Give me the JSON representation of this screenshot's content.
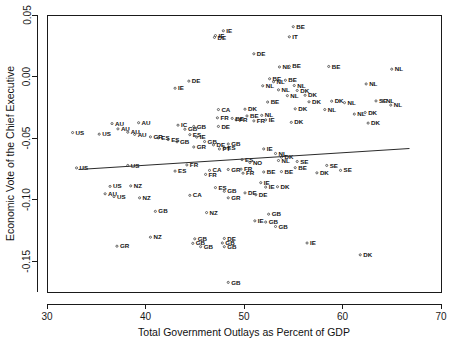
{
  "chart_data": {
    "type": "scatter",
    "title": "",
    "xlabel": "Total Government Outlays as Percent of GDP",
    "ylabel": "Economic Vote of the Chief Executive",
    "xlim": [
      30,
      70
    ],
    "ylim": [
      -0.175,
      0.05
    ],
    "xticks": [
      30,
      40,
      50,
      60,
      70
    ],
    "xtick_labels": [
      "30",
      "40",
      "50",
      "60",
      "70"
    ],
    "yticks": [
      0.05,
      0.0,
      -0.05,
      -0.1,
      -0.15
    ],
    "ytick_labels": [
      "0.05",
      "0.00",
      "-0.05",
      "-0.10",
      "-0.15"
    ],
    "grid": false,
    "legend": "none",
    "marker": "point-with-country-code-label",
    "fit_line": {
      "type": "linear-regression",
      "x_start": 33.2,
      "y_start": -0.0755,
      "x_end": 66.8,
      "y_end": -0.0585
    },
    "points": [
      {
        "label": "IE",
        "x": 47.9,
        "y": 0.0372
      },
      {
        "label": "IE",
        "x": 47.1,
        "y": 0.0333
      },
      {
        "label": "DE",
        "x": 47.0,
        "y": 0.0318
      },
      {
        "label": "BE",
        "x": 55.0,
        "y": 0.0405
      },
      {
        "label": "IT",
        "x": 54.6,
        "y": 0.0323
      },
      {
        "label": "DE",
        "x": 51.0,
        "y": 0.0185
      },
      {
        "label": "NL",
        "x": 53.6,
        "y": 0.0078
      },
      {
        "label": "BE",
        "x": 54.6,
        "y": 0.0083
      },
      {
        "label": "BE",
        "x": 58.6,
        "y": 0.0082
      },
      {
        "label": "DE",
        "x": 44.4,
        "y": -0.0037
      },
      {
        "label": "BE",
        "x": 52.6,
        "y": -0.0018
      },
      {
        "label": "NL",
        "x": 53.0,
        "y": -0.0042
      },
      {
        "label": "BE",
        "x": 54.2,
        "y": -0.003
      },
      {
        "label": "NL",
        "x": 51.9,
        "y": -0.0075
      },
      {
        "label": "NL",
        "x": 55.1,
        "y": -0.0073
      },
      {
        "label": "NL",
        "x": 62.4,
        "y": -0.006
      },
      {
        "label": "NL",
        "x": 65.0,
        "y": 0.006
      },
      {
        "label": "NL",
        "x": 53.5,
        "y": -0.0108
      },
      {
        "label": "DK",
        "x": 55.4,
        "y": -0.0113
      },
      {
        "label": "IE",
        "x": 43.0,
        "y": -0.0095
      },
      {
        "label": "NL",
        "x": 54.4,
        "y": -0.0155
      },
      {
        "label": "DK",
        "x": 56.2,
        "y": -0.0152
      },
      {
        "label": "AU",
        "x": 36.6,
        "y": -0.0382
      },
      {
        "label": "AU",
        "x": 39.3,
        "y": -0.0375
      },
      {
        "label": "AU",
        "x": 37.2,
        "y": -0.0425
      },
      {
        "label": "AU",
        "x": 38.9,
        "y": -0.047
      },
      {
        "label": "AU",
        "x": 38.2,
        "y": -0.0452
      },
      {
        "label": "US",
        "x": 32.6,
        "y": -0.0455
      },
      {
        "label": "US",
        "x": 35.3,
        "y": -0.0468
      },
      {
        "label": "IC",
        "x": 43.3,
        "y": -0.0395
      },
      {
        "label": "BE",
        "x": 52.4,
        "y": -0.0207
      },
      {
        "label": "DK",
        "x": 56.6,
        "y": -0.0205
      },
      {
        "label": "DK",
        "x": 58.9,
        "y": -0.02
      },
      {
        "label": "NL",
        "x": 60.2,
        "y": -0.0212
      },
      {
        "label": "SE",
        "x": 63.4,
        "y": -0.0198
      },
      {
        "label": "NL",
        "x": 64.1,
        "y": -0.02
      },
      {
        "label": "NL",
        "x": 64.9,
        "y": -0.0232
      },
      {
        "label": "CA",
        "x": 47.4,
        "y": -0.0268
      },
      {
        "label": "DK",
        "x": 50.1,
        "y": -0.0265
      },
      {
        "label": "DK",
        "x": 55.2,
        "y": -0.0262
      },
      {
        "label": "NL",
        "x": 58.2,
        "y": -0.0268
      },
      {
        "label": "GB",
        "x": 44.0,
        "y": -0.0428
      },
      {
        "label": "ES",
        "x": 44.5,
        "y": -0.0472
      },
      {
        "label": "IE",
        "x": 45.2,
        "y": -0.0492
      },
      {
        "label": "DE",
        "x": 47.4,
        "y": -0.0405
      },
      {
        "label": "GB",
        "x": 44.9,
        "y": -0.0405
      },
      {
        "label": "DK",
        "x": 62.3,
        "y": -0.0292
      },
      {
        "label": "NL",
        "x": 61.2,
        "y": -0.0305
      },
      {
        "label": "FR",
        "x": 49.2,
        "y": -0.0352
      },
      {
        "label": "BE",
        "x": 48.8,
        "y": -0.034
      },
      {
        "label": "FR",
        "x": 47.3,
        "y": -0.0335
      },
      {
        "label": "BE",
        "x": 50.3,
        "y": -0.032
      },
      {
        "label": "NL",
        "x": 51.8,
        "y": -0.0315
      },
      {
        "label": "IE",
        "x": 52.2,
        "y": -0.0352
      },
      {
        "label": "FR",
        "x": 51.0,
        "y": -0.036
      },
      {
        "label": "DK",
        "x": 54.8,
        "y": -0.0372
      },
      {
        "label": "DK",
        "x": 62.6,
        "y": -0.0378
      },
      {
        "label": "GB",
        "x": 43.2,
        "y": -0.053
      },
      {
        "label": "ES",
        "x": 42.3,
        "y": -0.0512
      },
      {
        "label": "ES",
        "x": 41.3,
        "y": -0.0498
      },
      {
        "label": "GR",
        "x": 40.5,
        "y": -0.049
      },
      {
        "label": "GB",
        "x": 46.0,
        "y": -0.0528
      },
      {
        "label": "DE",
        "x": 46.9,
        "y": -0.0555
      },
      {
        "label": "GB",
        "x": 48.4,
        "y": -0.0548
      },
      {
        "label": "ES",
        "x": 48.0,
        "y": -0.0582
      },
      {
        "label": "PT",
        "x": 47.5,
        "y": -0.0588
      },
      {
        "label": "GR",
        "x": 44.9,
        "y": -0.0572
      },
      {
        "label": "IE",
        "x": 52.0,
        "y": -0.0588
      },
      {
        "label": "NL",
        "x": 53.2,
        "y": -0.0625
      },
      {
        "label": "DK",
        "x": 53.8,
        "y": -0.0655
      },
      {
        "label": "NL",
        "x": 53.5,
        "y": -0.0682
      },
      {
        "label": "US",
        "x": 33.0,
        "y": -0.0742
      },
      {
        "label": "US",
        "x": 38.2,
        "y": -0.0722
      },
      {
        "label": "ES",
        "x": 43.0,
        "y": -0.0768
      },
      {
        "label": "CA",
        "x": 46.5,
        "y": -0.0762
      },
      {
        "label": "FR",
        "x": 44.2,
        "y": -0.0718
      },
      {
        "label": "FR",
        "x": 46.1,
        "y": -0.0795
      },
      {
        "label": "GR",
        "x": 48.4,
        "y": -0.0755
      },
      {
        "label": "NO",
        "x": 50.6,
        "y": -0.0698
      },
      {
        "label": "SE",
        "x": 55.4,
        "y": -0.069
      },
      {
        "label": "SE",
        "x": 58.4,
        "y": -0.0722
      },
      {
        "label": "BE",
        "x": 55.2,
        "y": -0.074
      },
      {
        "label": "FR",
        "x": 49.7,
        "y": -0.0752
      },
      {
        "label": "FR",
        "x": 49.9,
        "y": -0.0785
      },
      {
        "label": "BE",
        "x": 52.0,
        "y": -0.0775
      },
      {
        "label": "BE",
        "x": 53.8,
        "y": -0.0772
      },
      {
        "label": "DK",
        "x": 57.4,
        "y": -0.0782
      },
      {
        "label": "SE",
        "x": 59.8,
        "y": -0.0762
      },
      {
        "label": "ES",
        "x": 49.8,
        "y": -0.0675
      },
      {
        "label": "US",
        "x": 36.4,
        "y": -0.0892
      },
      {
        "label": "NZ",
        "x": 38.5,
        "y": -0.0888
      },
      {
        "label": "AU",
        "x": 35.9,
        "y": -0.0952
      },
      {
        "label": "US",
        "x": 36.8,
        "y": -0.0975
      },
      {
        "label": "NZ",
        "x": 39.4,
        "y": -0.0985
      },
      {
        "label": "CA",
        "x": 44.5,
        "y": -0.0965
      },
      {
        "label": "ES",
        "x": 47.1,
        "y": -0.0902
      },
      {
        "label": "GB",
        "x": 48.0,
        "y": -0.0932
      },
      {
        "label": "DE",
        "x": 50.1,
        "y": -0.0945
      },
      {
        "label": "DE",
        "x": 51.2,
        "y": -0.096
      },
      {
        "label": "GR",
        "x": 48.4,
        "y": -0.0985
      },
      {
        "label": "IE",
        "x": 51.7,
        "y": -0.0862
      },
      {
        "label": "IE",
        "x": 52.2,
        "y": -0.0898
      },
      {
        "label": "DK",
        "x": 53.4,
        "y": -0.0895
      },
      {
        "label": "GB",
        "x": 41.0,
        "y": -0.1095
      },
      {
        "label": "NZ",
        "x": 46.2,
        "y": -0.1105
      },
      {
        "label": "GB",
        "x": 52.5,
        "y": -0.1118
      },
      {
        "label": "GB",
        "x": 52.2,
        "y": -0.1182
      },
      {
        "label": "GB",
        "x": 53.2,
        "y": -0.1218
      },
      {
        "label": "IE",
        "x": 51.1,
        "y": -0.1172
      },
      {
        "label": "NZ",
        "x": 40.5,
        "y": -0.1305
      },
      {
        "label": "GB",
        "x": 45.0,
        "y": -0.1318
      },
      {
        "label": "DE",
        "x": 48.0,
        "y": -0.1315
      },
      {
        "label": "GB",
        "x": 44.8,
        "y": -0.1355
      },
      {
        "label": "GB",
        "x": 47.8,
        "y": -0.1352
      },
      {
        "label": "GB",
        "x": 45.6,
        "y": -0.1382
      },
      {
        "label": "GB",
        "x": 48.0,
        "y": -0.1382
      },
      {
        "label": "IE",
        "x": 56.4,
        "y": -0.1352
      },
      {
        "label": "GR",
        "x": 37.1,
        "y": -0.1378
      },
      {
        "label": "DK",
        "x": 61.8,
        "y": -0.1448
      },
      {
        "label": "GB",
        "x": 48.4,
        "y": -0.1672
      }
    ]
  }
}
